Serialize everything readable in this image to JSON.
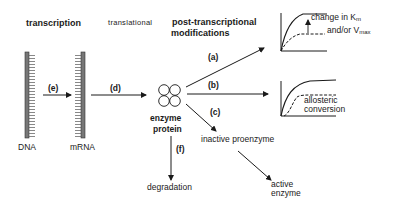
{
  "headers": {
    "transcription": "transcription",
    "translational": "translational",
    "post_transcriptional_line1": "post-transcriptional",
    "post_transcriptional_line2": "modifications"
  },
  "nodes": {
    "dna": "DNA",
    "mrna": "mRNA",
    "enzyme_line1": "enzyme",
    "enzyme_line2": "protein",
    "inactive_proenzyme": "inactive proenzyme",
    "active_line1": "active",
    "active_line2": "enzyme",
    "degradation": "degradation"
  },
  "arrows": {
    "a": "(a)",
    "b": "(b)",
    "c": "(c)",
    "d": "(d)",
    "e": "(e)",
    "f": "(f)"
  },
  "graphs": {
    "top": {
      "label_line1_prefix": "change in K",
      "label_line1_sub": "m",
      "label_line2_prefix": "and/or V",
      "label_line2_sub": "max"
    },
    "bottom": {
      "label_line1": "allosteric",
      "label_line2": "conversion"
    }
  }
}
